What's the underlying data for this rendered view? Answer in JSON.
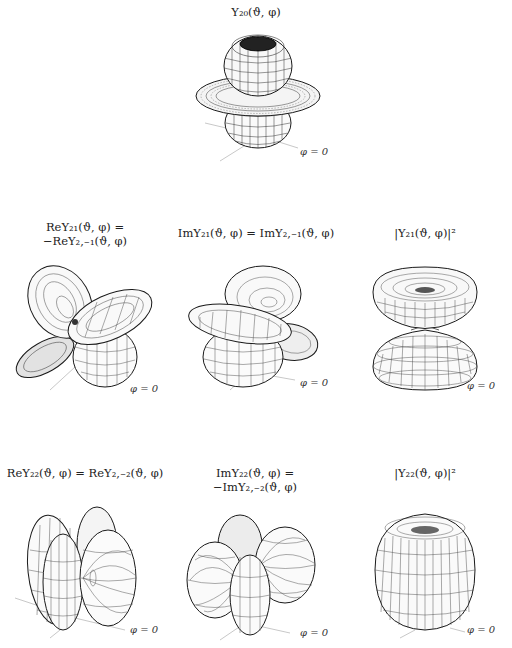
{
  "figure": {
    "axis_label": "φ = 0",
    "line_color": "#1a1a1a",
    "axis_color": "#c8c8c8",
    "background": "#ffffff"
  },
  "panels": [
    {
      "id": "y20",
      "row": 0,
      "col": 1,
      "title_lines": [
        "Y₂₀(ϑ, φ)"
      ],
      "shape": "d_z2",
      "phi_label": "φ = 0"
    },
    {
      "id": "re-y21",
      "row": 1,
      "col": 0,
      "title_lines": [
        "ReY₂₁(ϑ, φ) =",
        "−ReY₂,₋₁(ϑ, φ)"
      ],
      "shape": "d_xz",
      "phi_label": "φ = 0"
    },
    {
      "id": "im-y21",
      "row": 1,
      "col": 1,
      "title_lines": [
        "ImY₂₁(ϑ, φ) = ImY₂,₋₁(ϑ, φ)"
      ],
      "shape": "d_yz",
      "phi_label": "φ = 0"
    },
    {
      "id": "abs-y21-sq",
      "row": 1,
      "col": 2,
      "title_lines": [
        "|Y₂₁(ϑ, φ)|²"
      ],
      "shape": "double_cone",
      "phi_label": "φ = 0"
    },
    {
      "id": "re-y22",
      "row": 2,
      "col": 0,
      "title_lines": [
        "ReY₂₂(ϑ, φ) = ReY₂,₋₂(ϑ, φ)"
      ],
      "shape": "d_x2y2",
      "phi_label": "φ = 0"
    },
    {
      "id": "im-y22",
      "row": 2,
      "col": 1,
      "title_lines": [
        "ImY₂₂(ϑ, φ) =",
        "−ImY₂,₋₂(ϑ, φ)"
      ],
      "shape": "d_xy",
      "phi_label": "φ = 0"
    },
    {
      "id": "abs-y22-sq",
      "row": 2,
      "col": 2,
      "title_lines": [
        "|Y₂₂(ϑ, φ)|²"
      ],
      "shape": "barrel",
      "phi_label": "φ = 0"
    }
  ]
}
